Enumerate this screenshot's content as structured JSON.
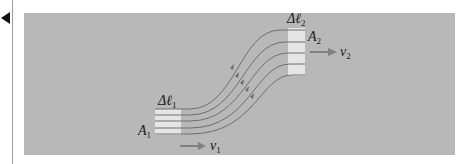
{
  "figure": {
    "labels": {
      "dl1": "Δℓ",
      "dl1_sub": "1",
      "dl2": "Δℓ",
      "dl2_sub": "2",
      "a1": "A",
      "a1_sub": "1",
      "a2": "A",
      "a2_sub": "2",
      "v1": "v",
      "v1_sub": "1",
      "v2": "v",
      "v2_sub": "2"
    },
    "colors": {
      "background": "#b8b8b8",
      "streamline": "#6e6e6e",
      "fluid_box": "#e6e6e6",
      "arrow": "#808080"
    },
    "streamline_count": 5
  }
}
